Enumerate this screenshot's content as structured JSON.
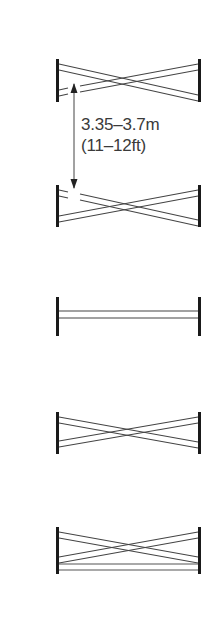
{
  "diagram": {
    "title": "",
    "colors": {
      "post": "#1a1a1a",
      "rail": "#444444",
      "arrow": "#444444",
      "text": "#3a3a3a",
      "background": "#ffffff"
    },
    "dimension": {
      "metric": "3.35–3.7m",
      "imperial": "(11–12ft)"
    },
    "gates": [
      {
        "id": 1,
        "style": "crossed-rails",
        "broken_left_rails": true
      },
      {
        "id": 2,
        "style": "crossed-rails",
        "broken_left_rails": true
      },
      {
        "id": 3,
        "style": "parallel-rails"
      },
      {
        "id": 4,
        "style": "crossed-rails"
      },
      {
        "id": 5,
        "style": "crossed-rails-with-bottom-rail"
      }
    ]
  }
}
